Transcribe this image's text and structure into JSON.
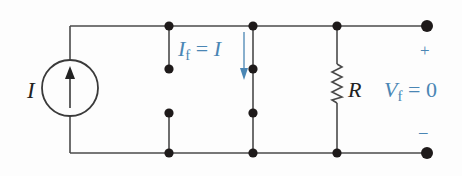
{
  "diagram": {
    "type": "circuit-schematic",
    "colors": {
      "wire": "#4a4a4a",
      "node": "#1e1a1a",
      "annotation": "#4a86b4",
      "label": "#222222"
    },
    "source": {
      "kind": "current-source",
      "label": "I",
      "arrow_direction": "up"
    },
    "switch_branch": {
      "annotation_main": "I",
      "annotation_sub": "f",
      "annotation_eq": " = ",
      "annotation_rhs": "I",
      "arrow_direction": "down"
    },
    "resistor": {
      "label": "R"
    },
    "output": {
      "voltage_main": "V",
      "voltage_sub": "f",
      "voltage_eq": " = ",
      "voltage_value": "0",
      "plus": "+",
      "minus": "–"
    }
  }
}
